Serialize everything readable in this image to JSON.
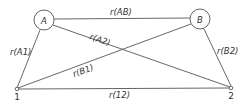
{
  "diagram": {
    "nodes": [
      {
        "id": "A",
        "label": "A",
        "type": "circle"
      },
      {
        "id": "B",
        "label": "B",
        "type": "circle"
      },
      {
        "id": "1",
        "label": "1",
        "type": "point"
      },
      {
        "id": "2",
        "label": "2",
        "type": "point"
      }
    ],
    "edges": [
      {
        "from": "A",
        "to": "B",
        "label": "r(AB)"
      },
      {
        "from": "A",
        "to": "1",
        "label": "r(A1)"
      },
      {
        "from": "A",
        "to": "2",
        "label": "r(A2)"
      },
      {
        "from": "B",
        "to": "1",
        "label": "r(B1)"
      },
      {
        "from": "B",
        "to": "2",
        "label": "r(B2)"
      },
      {
        "from": "1",
        "to": "2",
        "label": "r(12)"
      }
    ]
  }
}
